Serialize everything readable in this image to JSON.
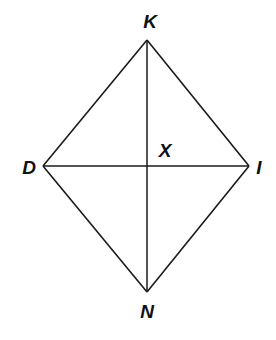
{
  "diagram": {
    "type": "quadrilateral-with-diagonals",
    "shape": "rhombus",
    "colors": {
      "line": "#1a1a1a",
      "label": "#111111",
      "background": "#ffffff"
    },
    "vertices": [
      {
        "id": "K",
        "label": "K",
        "x": 147,
        "y": 40
      },
      {
        "id": "I",
        "label": "I",
        "x": 249,
        "y": 166
      },
      {
        "id": "N",
        "label": "N",
        "x": 147,
        "y": 292
      },
      {
        "id": "D",
        "label": "D",
        "x": 43,
        "y": 166
      }
    ],
    "intersection": {
      "id": "X",
      "label": "X",
      "x": 147,
      "y": 166
    },
    "sides": [
      "KI",
      "IN",
      "ND",
      "DK"
    ],
    "diagonals": [
      "KN",
      "DI"
    ],
    "labels": {
      "K": "K",
      "D": "D",
      "I": "I",
      "N": "N",
      "X": "X"
    }
  }
}
